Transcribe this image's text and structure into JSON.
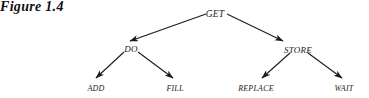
{
  "figure": {
    "caption": "Figure 1.4",
    "caption_x": 14,
    "caption_y": 78
  },
  "diagram": {
    "type": "tree",
    "stroke_color": "#1b1b1b",
    "background_color": "#ffffff",
    "nodes": [
      {
        "id": "get",
        "label": "GET",
        "level": 0,
        "x": 215,
        "y": 10,
        "class": "node-root"
      },
      {
        "id": "do",
        "label": "DO",
        "level": 1,
        "x": 131,
        "y": 45,
        "class": "node-mid"
      },
      {
        "id": "store",
        "label": "STORE",
        "level": 1,
        "x": 298,
        "y": 46,
        "class": "node-mid"
      },
      {
        "id": "add",
        "label": "ADD",
        "level": 2,
        "x": 96,
        "y": 85,
        "class": "node-leaf"
      },
      {
        "id": "fill",
        "label": "FILL",
        "level": 2,
        "x": 175,
        "y": 85,
        "class": "node-leaf"
      },
      {
        "id": "replace",
        "label": "REPLACE",
        "level": 2,
        "x": 256,
        "y": 85,
        "class": "node-leaf"
      },
      {
        "id": "wait",
        "label": "WAIT",
        "level": 2,
        "x": 344,
        "y": 85,
        "class": "node-leaf"
      }
    ],
    "edges": [
      {
        "id": "get-do",
        "from": "get",
        "to": "do",
        "x1": 206,
        "y1": 14,
        "x2": 130,
        "y2": 41
      },
      {
        "id": "get-store",
        "from": "get",
        "to": "store",
        "x1": 227,
        "y1": 14,
        "x2": 283,
        "y2": 41
      },
      {
        "id": "do-add",
        "from": "do",
        "to": "add",
        "x1": 124,
        "y1": 52,
        "x2": 96,
        "y2": 78
      },
      {
        "id": "do-fill",
        "from": "do",
        "to": "fill",
        "x1": 138,
        "y1": 52,
        "x2": 173,
        "y2": 78
      },
      {
        "id": "store-replace",
        "from": "store",
        "to": "replace",
        "x1": 290,
        "y1": 53,
        "x2": 262,
        "y2": 78
      },
      {
        "id": "store-wait",
        "from": "store",
        "to": "wait",
        "x1": 308,
        "y1": 53,
        "x2": 342,
        "y2": 78
      }
    ]
  }
}
